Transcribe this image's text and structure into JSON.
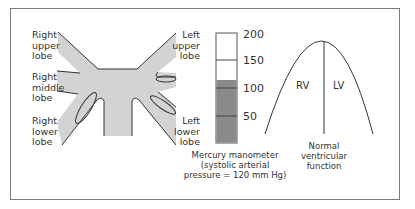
{
  "diagram": {
    "lungs": {
      "labels": {
        "right_upper": [
          "Right",
          "upper",
          "lobe"
        ],
        "right_middle": [
          "Right",
          "middle",
          "lobe"
        ],
        "right_lower": [
          "Right",
          "lower",
          "lobe"
        ],
        "left_upper": [
          "Left",
          "upper",
          "lobe"
        ],
        "left_lower": [
          "Left",
          "lower",
          "lobe"
        ]
      },
      "fill_color": "#d3d3d3"
    },
    "manometer": {
      "ticks": [
        "200",
        "150",
        "100",
        "50"
      ],
      "level_mmHg": 120,
      "fill_color": "#8a8a8a",
      "caption": [
        "Mercury manometer",
        "(systolic arterial",
        "pressure = 120 mm Hg)"
      ]
    },
    "ventricles": {
      "rv_label": "RV",
      "lv_label": "LV",
      "caption": [
        "Normal",
        "ventricular",
        "function"
      ]
    }
  }
}
